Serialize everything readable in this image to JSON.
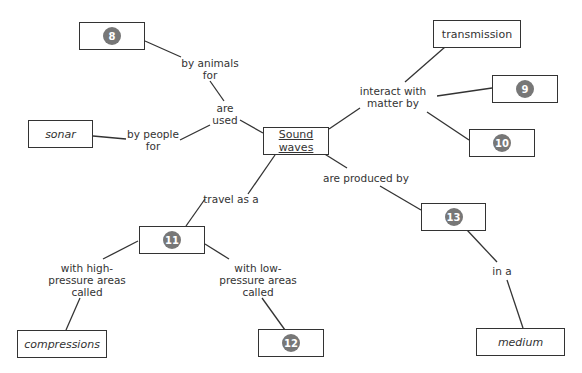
{
  "diagram": {
    "central": {
      "label": "Sound\nwaves"
    },
    "nodes": {
      "n8": {
        "badge": "8"
      },
      "sonar": {
        "label": "sonar"
      },
      "transmission": {
        "label": "transmission"
      },
      "n9": {
        "badge": "9"
      },
      "n10": {
        "badge": "10"
      },
      "n11": {
        "badge": "11"
      },
      "n12": {
        "badge": "12"
      },
      "n13": {
        "badge": "13"
      },
      "compressions": {
        "label": "compressions"
      },
      "medium": {
        "label": "medium"
      }
    },
    "links": {
      "are_used": "are\nused",
      "by_animals_for": "by animals\nfor",
      "by_people_for": "by people\nfor",
      "interact_with": "interact with\nmatter by",
      "are_produced_by": "are produced by",
      "travel_as_a": "travel as a",
      "in_a": "in a",
      "high_pressure": "with high-\npressure areas\ncalled",
      "low_pressure": "with low-\npressure areas\ncalled"
    },
    "colors": {
      "badge": "#777777",
      "line": "#333333"
    }
  }
}
